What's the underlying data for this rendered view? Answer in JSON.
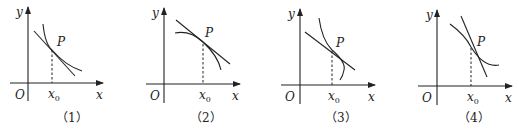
{
  "figures": [
    {
      "caption": "（1）",
      "labels": {
        "y": "y",
        "x": "x",
        "origin": "O",
        "point": "P",
        "x0": "x",
        "x0_sub": "0"
      },
      "description": "Decreasing concave-up curve with tangent line at P; curve lies above tangent"
    },
    {
      "caption": "（2）",
      "labels": {
        "y": "y",
        "x": "x",
        "origin": "O",
        "point": "P",
        "x0": "x",
        "x0_sub": "0"
      },
      "description": "Decreasing concave-down curve with tangent line at P; curve lies below tangent"
    },
    {
      "caption": "（3）",
      "labels": {
        "y": "y",
        "x": "x",
        "origin": "O",
        "point": "P",
        "x0": "x",
        "x0_sub": "0"
      },
      "description": "Curve with inflection at P, crossing tangent line (concave up left, concave down right)"
    },
    {
      "caption": "（4）",
      "labels": {
        "y": "y",
        "x": "x",
        "origin": "O",
        "point": "P",
        "x0": "x",
        "x0_sub": "0"
      },
      "description": "Curve with inflection at P, crossing tangent line (concave down left, concave up right)"
    }
  ]
}
